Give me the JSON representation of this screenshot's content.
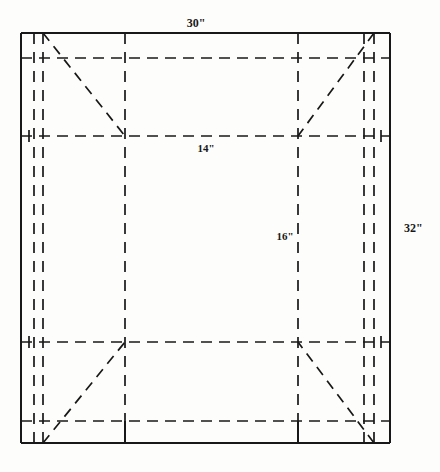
{
  "figure": {
    "type": "technical-drawing",
    "background_color": "#fdfdfb",
    "line_color": "#181818",
    "dimensions": {
      "top_width": "30\"",
      "right_height": "32\"",
      "inner_width": "14\"",
      "inner_height": "16\""
    },
    "labels": [
      {
        "id": "top-width",
        "text": "30\"",
        "x": 196,
        "y": 27,
        "anchor": "middle",
        "size": "normal"
      },
      {
        "id": "right-height",
        "text": "32\"",
        "x": 404,
        "y": 232,
        "anchor": "start",
        "size": "normal"
      },
      {
        "id": "inner-width",
        "text": "14\"",
        "x": 206,
        "y": 152,
        "anchor": "middle",
        "size": "small"
      },
      {
        "id": "inner-height",
        "text": "16\"",
        "x": 285,
        "y": 240,
        "anchor": "middle",
        "size": "small"
      }
    ],
    "outer_rect": {
      "x1": 21,
      "y1": 33,
      "x2": 390,
      "y2": 443
    },
    "solid_lines": [
      {
        "id": "outer-top",
        "x1": 21,
        "y1": 33,
        "x2": 390,
        "y2": 33
      },
      {
        "id": "outer-bottom",
        "x1": 21,
        "y1": 443,
        "x2": 390,
        "y2": 443
      },
      {
        "id": "outer-left",
        "x1": 21,
        "y1": 33,
        "x2": 21,
        "y2": 443
      },
      {
        "id": "outer-right",
        "x1": 390,
        "y1": 33,
        "x2": 390,
        "y2": 443
      },
      {
        "id": "bottom-tick-left",
        "x1": 125,
        "y1": 421,
        "x2": 125,
        "y2": 443
      },
      {
        "id": "bottom-tick-right",
        "x1": 298,
        "y1": 421,
        "x2": 298,
        "y2": 443
      }
    ],
    "dashed_verticals": [
      {
        "id": "left-outer-fold",
        "x": 34,
        "y1": 33,
        "y2": 443
      },
      {
        "id": "left-inner-fold",
        "x": 43,
        "y1": 33,
        "y2": 443
      },
      {
        "id": "center-left-fold",
        "x": 125,
        "y1": 33,
        "y2": 421
      },
      {
        "id": "center-right-fold",
        "x": 298,
        "y1": 33,
        "y2": 421
      },
      {
        "id": "right-inner-fold",
        "x": 364,
        "y1": 33,
        "y2": 443
      },
      {
        "id": "right-outer-fold",
        "x": 374,
        "y1": 33,
        "y2": 443
      }
    ],
    "dashed_horizontals": [
      {
        "id": "top-hem",
        "x1": 21,
        "y1": 58,
        "x2": 390,
        "y2": 58
      },
      {
        "id": "upper-fold",
        "x1": 21,
        "y1": 136,
        "x2": 390,
        "y2": 136
      },
      {
        "id": "lower-fold",
        "x1": 21,
        "y1": 342,
        "x2": 390,
        "y2": 342
      },
      {
        "id": "bottom-hem",
        "x1": 21,
        "y1": 421,
        "x2": 390,
        "y2": 421
      }
    ],
    "diagonals": [
      {
        "id": "corner-diagonal-top-left",
        "x1": 43,
        "y1": 33,
        "x2": 125,
        "y2": 136
      },
      {
        "id": "corner-diagonal-top-right",
        "x1": 374,
        "y1": 33,
        "x2": 298,
        "y2": 136
      },
      {
        "id": "corner-diagonal-bottom-left",
        "x1": 43,
        "y1": 443,
        "x2": 125,
        "y2": 342
      },
      {
        "id": "corner-diagonal-bottom-right",
        "x1": 374,
        "y1": 443,
        "x2": 298,
        "y2": 342
      }
    ],
    "crosshair_ticks": [
      {
        "id": "tick-left-upper",
        "x": 29,
        "y": 136
      },
      {
        "id": "tick-left-lower",
        "x": 29,
        "y": 342
      },
      {
        "id": "tick-right-upper",
        "x": 381,
        "y": 136
      },
      {
        "id": "tick-right-lower",
        "x": 381,
        "y": 342
      }
    ]
  }
}
